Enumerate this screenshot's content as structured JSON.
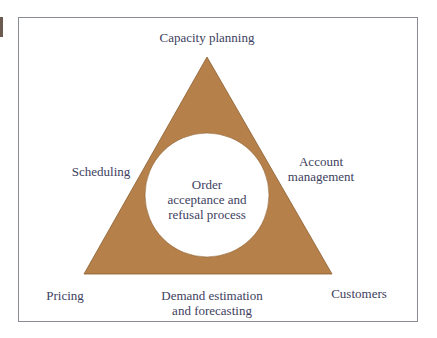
{
  "diagram": {
    "type": "triangle-with-inner-circle",
    "colors": {
      "triangle_fill": "#b5804a",
      "triangle_edge": "#8c5e30",
      "circle_fill": "#ffffff",
      "text": "#3d4160",
      "frame_border": "#8a8c94"
    },
    "center": {
      "line1": "Order",
      "line2": "acceptance and",
      "line3": "refusal process"
    },
    "labels": {
      "top": "Capacity planning",
      "upper_left": "Scheduling",
      "upper_right_line1": "Account",
      "upper_right_line2": "management",
      "bottom_left": "Pricing",
      "bottom_center_line1": "Demand estimation",
      "bottom_center_line2": "and forecasting",
      "bottom_right": "Customers"
    }
  }
}
